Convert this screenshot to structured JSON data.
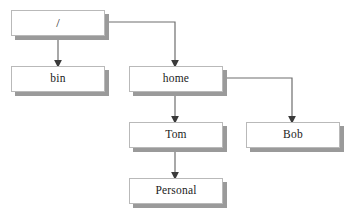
{
  "diagram": {
    "background_color": "#ffffff",
    "box_fill_color": "#ffffff",
    "box_border_color": "#b9b9b9",
    "box_shadow_color": "#9a9a9a",
    "edge_color": "#6e6e6e",
    "text_color": "#1b1b1b",
    "nodes": [
      {
        "id": "root",
        "label": "/",
        "x": 11,
        "y": 10,
        "w": 94,
        "h": 26
      },
      {
        "id": "bin",
        "label": "bin",
        "x": 11,
        "y": 66,
        "w": 94,
        "h": 26
      },
      {
        "id": "home",
        "label": "home",
        "x": 129,
        "y": 66,
        "w": 94,
        "h": 26
      },
      {
        "id": "tom",
        "label": "Tom",
        "x": 129,
        "y": 122,
        "w": 94,
        "h": 26
      },
      {
        "id": "bob",
        "label": "Bob",
        "x": 246,
        "y": 122,
        "w": 94,
        "h": 26
      },
      {
        "id": "personal",
        "label": "Personal",
        "x": 129,
        "y": 178,
        "w": 94,
        "h": 26
      }
    ],
    "edges": [
      {
        "id": "root-bin",
        "from": "root",
        "to": "bin",
        "kind": "straight-down"
      },
      {
        "id": "root-home",
        "from": "root",
        "to": "home",
        "kind": "right-then-down"
      },
      {
        "id": "home-tom",
        "from": "home",
        "to": "tom",
        "kind": "straight-down"
      },
      {
        "id": "home-bob",
        "from": "home",
        "to": "bob",
        "kind": "right-then-down"
      },
      {
        "id": "tom-personal",
        "from": "tom",
        "to": "personal",
        "kind": "straight-down"
      }
    ]
  }
}
